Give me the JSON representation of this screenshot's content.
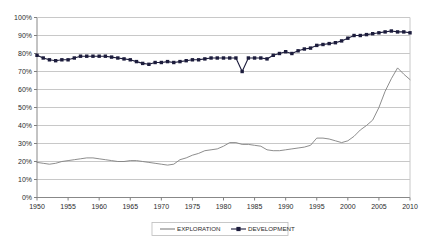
{
  "chart_data": {
    "type": "line",
    "title": "",
    "subtitle": "",
    "xlabel": "",
    "ylabel": "",
    "xlim": [
      1950,
      2010
    ],
    "ylim": [
      0,
      1.0
    ],
    "grid": true,
    "grid_axis": "y",
    "legend_position": "bottom",
    "x_tick_labels": [
      "1950",
      "1955",
      "1960",
      "1965",
      "1970",
      "1975",
      "1980",
      "1985",
      "1990",
      "1995",
      "2000",
      "2005",
      "2010"
    ],
    "x_tick_values": [
      1950,
      1955,
      1960,
      1965,
      1970,
      1975,
      1980,
      1985,
      1990,
      1995,
      2000,
      2005,
      2010
    ],
    "y_tick_labels": [
      "0%",
      "10%",
      "20%",
      "30%",
      "40%",
      "50%",
      "60%",
      "70%",
      "80%",
      "90%",
      "100%"
    ],
    "y_tick_values": [
      0,
      0.1,
      0.2,
      0.3,
      0.4,
      0.5,
      0.6,
      0.7,
      0.8,
      0.9,
      1.0
    ],
    "x": [
      1950,
      1951,
      1952,
      1953,
      1954,
      1955,
      1956,
      1957,
      1958,
      1959,
      1960,
      1961,
      1962,
      1963,
      1964,
      1965,
      1966,
      1967,
      1968,
      1969,
      1970,
      1971,
      1972,
      1973,
      1974,
      1975,
      1976,
      1977,
      1978,
      1979,
      1980,
      1981,
      1982,
      1983,
      1984,
      1985,
      1986,
      1987,
      1988,
      1989,
      1990,
      1991,
      1992,
      1993,
      1994,
      1995,
      1996,
      1997,
      1998,
      1999,
      2000,
      2001,
      2002,
      2003,
      2004,
      2005,
      2006,
      2007,
      2008,
      2009,
      2010
    ],
    "series": [
      {
        "name": "EXPLORATION",
        "color": "#808080",
        "marker": "none",
        "values": [
          0.195,
          0.19,
          0.185,
          0.19,
          0.2,
          0.205,
          0.21,
          0.215,
          0.22,
          0.22,
          0.215,
          0.21,
          0.205,
          0.2,
          0.2,
          0.205,
          0.205,
          0.2,
          0.195,
          0.19,
          0.185,
          0.18,
          0.185,
          0.21,
          0.22,
          0.235,
          0.245,
          0.26,
          0.265,
          0.27,
          0.285,
          0.305,
          0.305,
          0.295,
          0.295,
          0.29,
          0.285,
          0.265,
          0.26,
          0.26,
          0.265,
          0.27,
          0.275,
          0.28,
          0.29,
          0.33,
          0.33,
          0.325,
          0.315,
          0.305,
          0.315,
          0.34,
          0.375,
          0.4,
          0.43,
          0.5,
          0.59,
          0.66,
          0.72,
          0.685,
          0.655
        ]
      },
      {
        "name": "DEVELOPMENT",
        "color": "#1c1c3c",
        "marker": "square",
        "values": [
          0.79,
          0.775,
          0.765,
          0.76,
          0.765,
          0.765,
          0.775,
          0.785,
          0.785,
          0.785,
          0.785,
          0.785,
          0.78,
          0.775,
          0.77,
          0.765,
          0.755,
          0.745,
          0.74,
          0.75,
          0.75,
          0.755,
          0.75,
          0.755,
          0.76,
          0.765,
          0.765,
          0.77,
          0.775,
          0.775,
          0.775,
          0.775,
          0.775,
          0.7,
          0.775,
          0.775,
          0.775,
          0.77,
          0.79,
          0.8,
          0.81,
          0.8,
          0.815,
          0.825,
          0.83,
          0.845,
          0.85,
          0.855,
          0.86,
          0.87,
          0.885,
          0.9,
          0.9,
          0.905,
          0.91,
          0.915,
          0.92,
          0.925,
          0.92,
          0.92,
          0.915
        ]
      }
    ]
  },
  "legend": {
    "items": [
      {
        "label": "EXPLORATION",
        "marker": "line"
      },
      {
        "label": "DEVELOPMENT",
        "marker": "line-square"
      }
    ]
  },
  "colors": {
    "exploration": "#808080",
    "development": "#1c1c3c",
    "grid": "#c8c8c8",
    "axis": "#808080",
    "text": "#2b2b2b",
    "background": "#ffffff"
  }
}
